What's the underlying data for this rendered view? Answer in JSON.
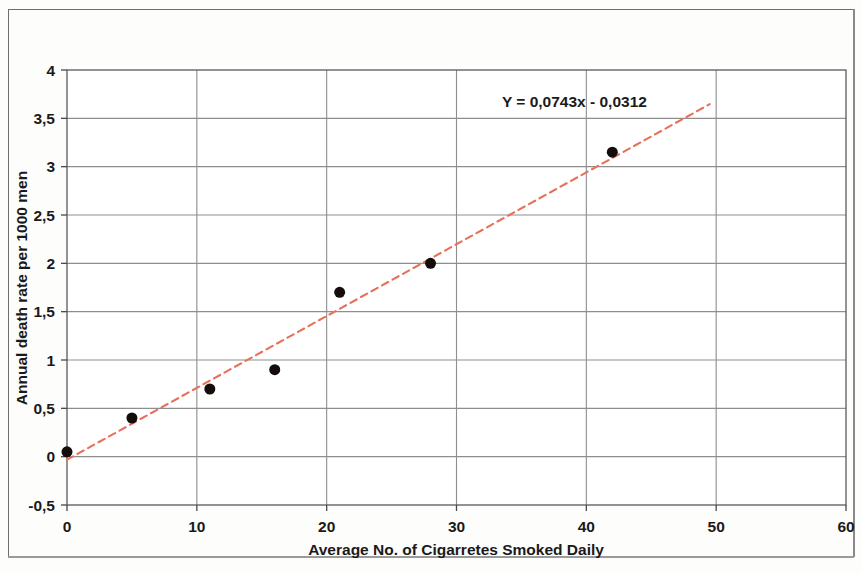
{
  "chart_data": {
    "type": "scatter",
    "title": "",
    "xlabel": "Average No. of Cigarretes Smoked Daily",
    "ylabel": "Annual death rate per 1000 men",
    "xlim": [
      0,
      60
    ],
    "ylim": [
      -0.5,
      4
    ],
    "x_ticks": [
      "0",
      "10",
      "20",
      "30",
      "40",
      "50",
      "60"
    ],
    "x_tick_values": [
      0,
      10,
      20,
      30,
      40,
      50,
      60
    ],
    "y_ticks": [
      "-0,5",
      "0",
      "0,5",
      "1",
      "1,5",
      "2",
      "2,5",
      "3",
      "3,5",
      "4"
    ],
    "y_tick_values": [
      -0.5,
      0,
      0.5,
      1,
      1.5,
      2,
      2.5,
      3,
      3.5,
      4
    ],
    "grid": true,
    "legend": false,
    "points": [
      {
        "x": 0,
        "y": 0.05
      },
      {
        "x": 5,
        "y": 0.4
      },
      {
        "x": 11,
        "y": 0.7
      },
      {
        "x": 16,
        "y": 0.9
      },
      {
        "x": 21,
        "y": 1.7
      },
      {
        "x": 28,
        "y": 2.0
      },
      {
        "x": 42,
        "y": 3.15
      }
    ],
    "marker_color": "#140d0b",
    "marker_size": 11,
    "trendline": {
      "equation_text": "Y = 0,0743x - 0,0312",
      "slope": 0.0743,
      "intercept": -0.0312,
      "x_start": 0,
      "x_end": 49.5,
      "color": "#E8705A",
      "style": "dashed"
    },
    "annotations": [
      {
        "text": "Y = 0,0743x - 0,0312",
        "x": 33.5,
        "y": 3.62
      }
    ]
  },
  "axes": {
    "x_axis_title": "Average No. of Cigarretes Smoked Daily",
    "y_axis_title": "Annual death rate per 1000 men"
  },
  "colors": {
    "trendline": "#E8705A",
    "marker": "#140d0b",
    "grid": "#8e8e8e",
    "frame": "#6e6e6e",
    "text": "#1a1a1a"
  }
}
